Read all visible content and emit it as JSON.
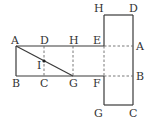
{
  "diagram": {
    "type": "cuboid-net",
    "colors": {
      "line": "#3a3a3a",
      "dashed": "#6a6a6a",
      "text": "#333333",
      "background": "#ffffff"
    },
    "labels": {
      "top_A": "A",
      "top_D": "D",
      "top_H": "H",
      "top_E": "E",
      "right_A": "A",
      "bottom_B": "B",
      "bottom_C": "C",
      "bottom_G": "G",
      "bottom_F": "F",
      "right_B": "B",
      "point_I": "I",
      "tall_top_H": "H",
      "tall_top_D": "D",
      "tall_bottom_G": "G",
      "tall_bottom_C": "C"
    }
  }
}
